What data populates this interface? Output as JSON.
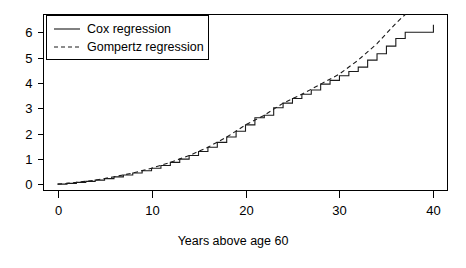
{
  "chart_data": {
    "type": "line",
    "title": "",
    "xlabel": "Years above age 60",
    "ylabel": "",
    "xlim": [
      -1.5,
      41.5
    ],
    "ylim": [
      -0.25,
      6.7
    ],
    "xticks": [
      0,
      10,
      20,
      30,
      40
    ],
    "yticks": [
      0,
      1,
      2,
      3,
      4,
      5,
      6
    ],
    "xtick_labels": [
      "0",
      "10",
      "20",
      "30",
      "40"
    ],
    "ytick_labels": [
      "0",
      "1",
      "2",
      "3",
      "4",
      "5",
      "6"
    ],
    "grid": false,
    "legend_position": "top-left",
    "legend_entries": [
      {
        "label": "Cox regression",
        "style": "solid"
      },
      {
        "label": "Gompertz regression",
        "style": "dashed"
      }
    ],
    "series": [
      {
        "name": "Cox regression",
        "style": "step",
        "x": [
          0,
          1,
          2,
          3,
          4,
          5,
          6,
          7,
          8,
          9,
          10,
          11,
          12,
          13,
          14,
          15,
          16,
          17,
          18,
          19,
          20,
          21,
          22,
          23,
          24,
          25,
          26,
          27,
          28,
          29,
          30,
          31,
          32,
          33,
          34,
          35,
          36,
          37,
          38,
          39,
          40
        ],
        "y": [
          0.0,
          0.03,
          0.07,
          0.11,
          0.16,
          0.22,
          0.29,
          0.36,
          0.44,
          0.53,
          0.63,
          0.74,
          0.86,
          0.99,
          1.13,
          1.29,
          1.46,
          1.65,
          1.86,
          2.09,
          2.34,
          2.62,
          2.72,
          3.02,
          3.2,
          3.38,
          3.55,
          3.72,
          3.95,
          4.1,
          4.28,
          4.45,
          4.62,
          4.9,
          5.15,
          5.45,
          5.75,
          6.0,
          6.0,
          6.0,
          6.3
        ]
      },
      {
        "name": "Gompertz regression",
        "style": "smooth",
        "x": [
          0,
          2,
          4,
          6,
          8,
          10,
          12,
          14,
          16,
          18,
          20,
          22,
          24,
          26,
          28,
          30,
          32,
          34,
          36,
          37
        ],
        "y": [
          0.0,
          0.07,
          0.16,
          0.29,
          0.44,
          0.63,
          0.86,
          1.13,
          1.46,
          1.86,
          2.34,
          2.72,
          3.2,
          3.55,
          3.95,
          4.35,
          4.9,
          5.55,
          6.35,
          6.7
        ]
      }
    ]
  },
  "figure": {
    "background_color": "#ffffff",
    "line_color": "#1a1a1a"
  }
}
